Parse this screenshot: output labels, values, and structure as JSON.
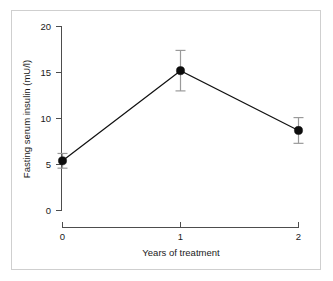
{
  "figure": {
    "name": "fasting-serum-insulin-over-treatment-years",
    "frame_color": "#cfcfcf",
    "background": "#ffffff"
  },
  "axis": {
    "y_title": "Fasting serum insulin (mU/l)",
    "x_title": "Years of treatment",
    "y_ticks": [
      "0",
      "5",
      "10",
      "15",
      "20"
    ],
    "x_ticks": [
      "0",
      "1",
      "2"
    ]
  },
  "labels": {
    "y_20": "20",
    "y_15": "15",
    "y_10": "10",
    "y_5": "5",
    "y_0": "0",
    "x_0": "0",
    "x_1": "1",
    "x_2": "2"
  },
  "chart_data": {
    "type": "line",
    "title": "",
    "subtitle": "",
    "xlabel": "Years of treatment",
    "ylabel": "Fasting serum insulin (mU/l)",
    "x": [
      0,
      1,
      2
    ],
    "xticklabels": [
      "0",
      "1",
      "2"
    ],
    "yticklabels": [
      "0",
      "5",
      "10",
      "15",
      "20"
    ],
    "xlim": [
      0,
      2
    ],
    "ylim": [
      0,
      20
    ],
    "grid": false,
    "legend": null,
    "marker": "filled-circle",
    "error_bar_style": "vertical-with-caps",
    "series": [
      {
        "name": "Fasting serum insulin",
        "values": [
          5.4,
          15.2,
          8.7
        ],
        "errors": [
          0.8,
          2.2,
          1.4
        ],
        "error_lower": [
          4.6,
          13.0,
          7.3
        ],
        "error_upper": [
          6.2,
          17.4,
          10.1
        ],
        "color": "#0d0d0d",
        "error_color": "#9a9a9a"
      }
    ],
    "annotations": []
  }
}
